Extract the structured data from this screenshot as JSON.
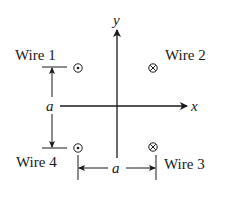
{
  "diagram": {
    "type": "four-wire configuration",
    "axes": {
      "x_label": "x",
      "y_label": "y"
    },
    "wires": [
      {
        "label": "Wire 1",
        "direction": "out-of-page",
        "symbol": "dot-circle",
        "quadrant": "upper-left"
      },
      {
        "label": "Wire 2",
        "direction": "into-page",
        "symbol": "cross-circle",
        "quadrant": "upper-right"
      },
      {
        "label": "Wire 3",
        "direction": "into-page",
        "symbol": "cross-circle",
        "quadrant": "lower-right"
      },
      {
        "label": "Wire 4",
        "direction": "out-of-page",
        "symbol": "dot-circle",
        "quadrant": "lower-left"
      }
    ],
    "dimensions": {
      "vertical_label": "a",
      "horizontal_label": "a"
    },
    "colors": {
      "ink": "#1a1a1a",
      "background": "#ffffff"
    }
  }
}
